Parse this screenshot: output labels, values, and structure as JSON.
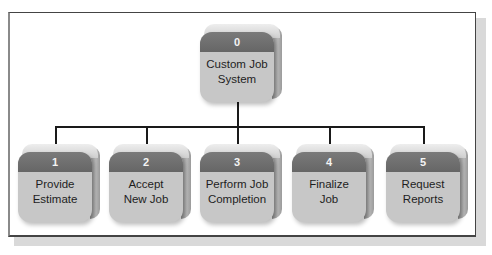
{
  "diagram": {
    "type": "hierarchy-chart",
    "root": {
      "number": "0",
      "label_line1": "Custom Job",
      "label_line2": "System"
    },
    "children": [
      {
        "number": "1",
        "label_line1": "Provide",
        "label_line2": "Estimate"
      },
      {
        "number": "2",
        "label_line1": "Accept",
        "label_line2": "New Job"
      },
      {
        "number": "3",
        "label_line1": "Perform Job",
        "label_line2": "Completion"
      },
      {
        "number": "4",
        "label_line1": "Finalize",
        "label_line2": "Job"
      },
      {
        "number": "5",
        "label_line1": "Request",
        "label_line2": "Reports"
      }
    ],
    "colors": {
      "band": "#6b6b6b",
      "face": "#c7c7c7",
      "connector": "#1a1a1a",
      "frame": "#444444"
    }
  }
}
